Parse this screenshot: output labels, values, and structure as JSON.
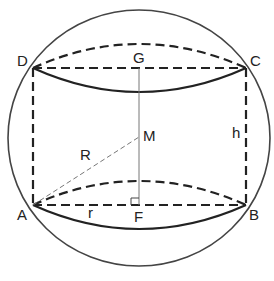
{
  "diagram": {
    "type": "geometry",
    "colors": {
      "stroke": "#222222",
      "sphere": "#444444",
      "thin_dashed": "#777777"
    },
    "points": {
      "A": {
        "label": "A",
        "x": 33,
        "y": 205
      },
      "B": {
        "label": "B",
        "x": 246,
        "y": 205
      },
      "C": {
        "label": "C",
        "x": 246,
        "y": 68
      },
      "D": {
        "label": "D",
        "x": 33,
        "y": 68
      },
      "G": {
        "label": "G",
        "x": 139,
        "y": 68
      },
      "M": {
        "label": "M",
        "x": 139,
        "y": 137
      },
      "F": {
        "label": "F",
        "x": 139,
        "y": 205
      }
    },
    "segment_labels": {
      "R": "R",
      "r": "r",
      "h": "h"
    }
  }
}
